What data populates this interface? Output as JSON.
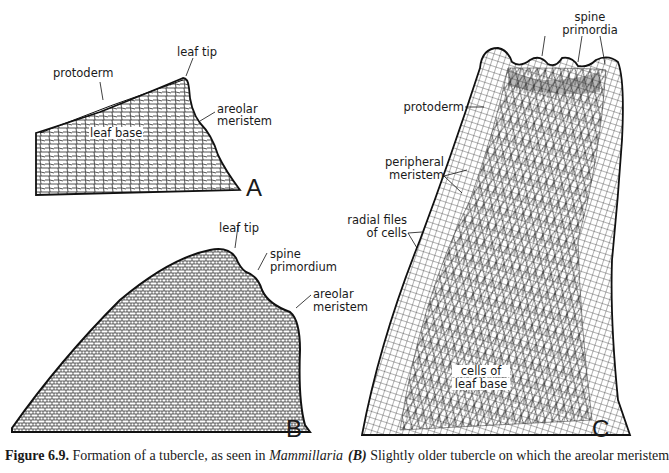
{
  "figure": {
    "panels": [
      {
        "id": "A",
        "letter": "A",
        "labels": {
          "leaf_tip": "leaf tip",
          "protoderm": "protoderm",
          "areolar_meristem_1": "areolar",
          "areolar_meristem_2": "meristem",
          "leaf_base": "leaf base"
        }
      },
      {
        "id": "B",
        "letter": "B",
        "labels": {
          "leaf_tip": "leaf tip",
          "spine_primordium_1": "spine",
          "spine_primordium_2": "primordium",
          "areolar_meristem_1": "areolar",
          "areolar_meristem_2": "meristem"
        }
      },
      {
        "id": "C",
        "letter": "C",
        "labels": {
          "spine_primordia_1": "spine",
          "spine_primordia_2": "primordia",
          "protoderm": "protoderm",
          "peripheral_meristem_1": "peripheral",
          "peripheral_meristem_2": "meristem",
          "radial_files_1": "radial files",
          "radial_files_2": "of cells",
          "cells_leaf_base_1": "cells of",
          "cells_leaf_base_2": "leaf base"
        }
      }
    ]
  },
  "caption": {
    "left": {
      "figure_number": "Figure 6.9.",
      "text": " Formation of a tubercle, as seen in ",
      "genus": "Mammillaria"
    },
    "right": {
      "panel_ref": "(B)",
      "text": " Slightly older tubercle on which the areolar meristem"
    }
  }
}
